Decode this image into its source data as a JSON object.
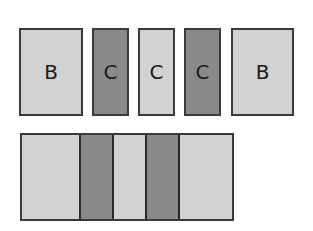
{
  "diagram": {
    "top_row": [
      {
        "label": "B",
        "shade": "light",
        "x": 19,
        "y": 28,
        "w": 64,
        "h": 88
      },
      {
        "label": "C",
        "shade": "dark",
        "x": 92,
        "y": 28,
        "w": 37,
        "h": 88
      },
      {
        "label": "C",
        "shade": "light",
        "x": 138,
        "y": 28,
        "w": 37,
        "h": 88
      },
      {
        "label": "C",
        "shade": "dark",
        "x": 184,
        "y": 28,
        "w": 37,
        "h": 88
      },
      {
        "label": "B",
        "shade": "light",
        "x": 231,
        "y": 28,
        "w": 63,
        "h": 88
      }
    ],
    "bottom_strip": {
      "x": 20,
      "y": 133,
      "w": 214,
      "h": 88,
      "segments": [
        {
          "shade": "light",
          "w": 57
        },
        {
          "shade": "dark",
          "w": 33
        },
        {
          "shade": "light",
          "w": 33
        },
        {
          "shade": "dark",
          "w": 33
        },
        {
          "shade": "light",
          "w": 54
        }
      ]
    },
    "colors": {
      "light": "#d2d2d2",
      "dark": "#8a8a8a",
      "border": "#3a3a3a"
    }
  }
}
